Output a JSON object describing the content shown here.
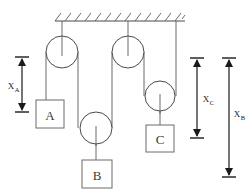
{
  "figure": {
    "background_color": "#ffffff",
    "line_color": "#4a4a4a",
    "rope_color": "#5a5a5a",
    "dimension_color": "#1a1a1a",
    "width": 248,
    "height": 192
  },
  "support": {
    "name": "ceiling",
    "hatch_count": 13,
    "x_start": 55,
    "x_end": 185,
    "y": 21
  },
  "pulleys": [
    {
      "id": "pulley-left-fixed",
      "type": "fixed",
      "cx": 62,
      "cy": 52,
      "r": 16
    },
    {
      "id": "pulley-mid-fixed",
      "type": "fixed",
      "cx": 128,
      "cy": 52,
      "r": 16
    },
    {
      "id": "pulley-b-movable",
      "type": "movable",
      "cx": 96,
      "cy": 128,
      "r": 16
    },
    {
      "id": "pulley-c-movable",
      "type": "movable",
      "cx": 160,
      "cy": 96,
      "r": 15
    }
  ],
  "blocks": [
    {
      "id": "block-a",
      "label": "A",
      "x": 36,
      "y": 100,
      "w": 28,
      "h": 28
    },
    {
      "id": "block-b",
      "label": "B",
      "x": 82,
      "y": 160,
      "w": 30,
      "h": 28
    },
    {
      "id": "block-c",
      "label": "C",
      "x": 146,
      "y": 125,
      "w": 28,
      "h": 27
    }
  ],
  "dimensions": [
    {
      "id": "dim-xa",
      "base_label": "X",
      "subscript": "A",
      "x": 22,
      "y_top": 57,
      "y_bottom": 112,
      "label_x": 13,
      "label_y": 85,
      "measures": "block-a"
    },
    {
      "id": "dim-xc",
      "base_label": "X",
      "subscript": "C",
      "x": 197,
      "y_top": 58,
      "y_bottom": 138,
      "label_x": 207,
      "label_y": 99,
      "measures": "block-c"
    },
    {
      "id": "dim-xb",
      "base_label": "X",
      "subscript": "B",
      "x": 229,
      "y_top": 58,
      "y_bottom": 177,
      "label_x": 238,
      "label_y": 114,
      "measures": "block-b"
    }
  ],
  "ropes": [
    {
      "id": "rope-ceiling-to-left-pulley",
      "from": "ceiling",
      "to": "pulley-left-fixed"
    },
    {
      "id": "rope-ceiling-to-mid-pulley",
      "from": "ceiling",
      "to": "pulley-mid-fixed"
    },
    {
      "id": "rope-left-pulley-to-block-a",
      "from": "pulley-left-fixed",
      "to": "block-a"
    },
    {
      "id": "rope-left-pulley-to-pulley-b",
      "from": "pulley-left-fixed",
      "to": "pulley-b-movable"
    },
    {
      "id": "rope-pulley-b-to-mid-pulley",
      "from": "pulley-b-movable",
      "to": "pulley-mid-fixed"
    },
    {
      "id": "rope-mid-pulley-to-pulley-c",
      "from": "pulley-mid-fixed",
      "to": "pulley-c-movable"
    },
    {
      "id": "rope-pulley-c-to-ceiling",
      "from": "pulley-c-movable",
      "to": "ceiling"
    },
    {
      "id": "rope-pulley-b-to-block-b",
      "from": "pulley-b-movable",
      "to": "block-b"
    },
    {
      "id": "rope-pulley-c-to-block-c",
      "from": "pulley-c-movable",
      "to": "block-c"
    }
  ]
}
